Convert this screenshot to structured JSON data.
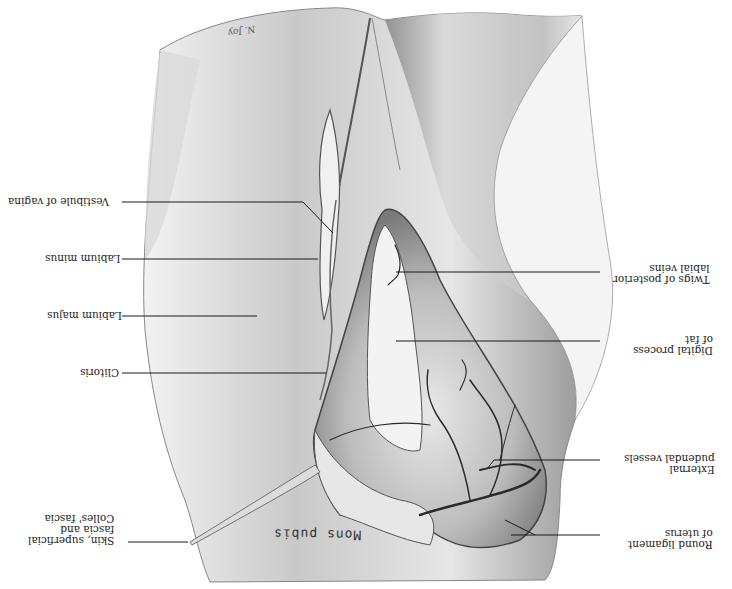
{
  "figure": {
    "orientation": "rotated 180 degrees",
    "style": "grayscale pencil anatomical illustration",
    "signature": "N. Joy",
    "region_text": "Mons pubis",
    "colors": {
      "background": "#ffffff",
      "skin_light": "#e9e9e9",
      "skin_mid": "#bdbdbd",
      "skin_dark": "#6e6e6e",
      "vessels": "#2a2a2a",
      "leader_lines": "#1a1a1a"
    }
  },
  "labels_left": [
    {
      "id": "vestibule",
      "lines": [
        "Vestibule of vagina"
      ]
    },
    {
      "id": "labium-minus",
      "lines": [
        "Labium minus"
      ]
    },
    {
      "id": "labium-majus",
      "lines": [
        "Labium majus"
      ]
    },
    {
      "id": "clitoris",
      "lines": [
        "Clitoris"
      ]
    },
    {
      "id": "skin-fascia",
      "lines": [
        "Skin, superficial",
        "fascia and",
        "Colles' fascia"
      ]
    }
  ],
  "labels_right": [
    {
      "id": "posterior-labial-veins",
      "lines": [
        "Twigs of posterior",
        "labial veins"
      ]
    },
    {
      "id": "digital-process",
      "lines": [
        "Digital process",
        "of fat"
      ]
    },
    {
      "id": "external-pudendal",
      "lines": [
        "External",
        "pudendal vessels"
      ]
    },
    {
      "id": "round-ligament",
      "lines": [
        "Round ligament",
        "of uterus"
      ]
    }
  ]
}
